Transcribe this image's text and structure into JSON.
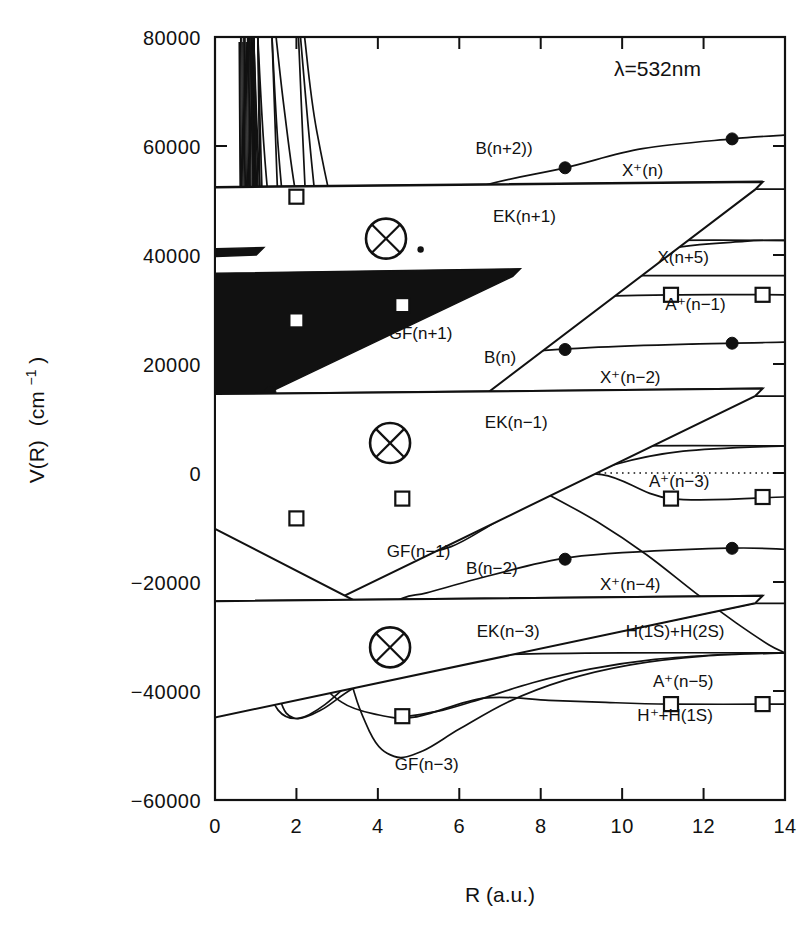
{
  "figure": {
    "annotation": "λ=532nm",
    "xlabel": "R (a.u.)",
    "ylabel_main": "V(R)",
    "ylabel_unit": "(cm",
    "ylabel_exp": "−1",
    "ylabel_close": ")"
  },
  "chart_data": {
    "type": "line",
    "title": "",
    "subtitle": "",
    "annotations": [
      "λ=532nm"
    ],
    "xlabel": "R (a.u.)",
    "ylabel": "V(R) (cm−1)",
    "xlim": [
      0,
      14
    ],
    "ylim": [
      -60000,
      80000
    ],
    "xticks": [
      0,
      2,
      4,
      6,
      8,
      10,
      12,
      14
    ],
    "yticks": [
      -60000,
      -40000,
      -20000,
      0,
      20000,
      40000,
      60000,
      80000
    ],
    "grid": false,
    "legend": "inline curve labels at right",
    "zero_line": {
      "value": 0,
      "style": "dotted"
    },
    "markers": {
      "filled-circle": "B state series",
      "open-triangle": "X+ ion series",
      "filled-triangle": "X(n+5) neutral series",
      "open-square": "A+ series",
      "crossed-circle": "avoided crossing / resonance point"
    },
    "crossing_points": [
      {
        "x": 4.2,
        "y": 43000
      },
      {
        "x": 4.3,
        "y": 5500
      },
      {
        "x": 4.3,
        "y": -32000
      }
    ],
    "series": [
      {
        "name": "B(n+2))",
        "label": "B(n+2))",
        "marker": "filled-circle",
        "asymptote": 62000,
        "points": [
          [
            0.95,
            80000
          ],
          [
            1.05,
            60000
          ],
          [
            1.2,
            40000
          ],
          [
            1.35,
            33500
          ],
          [
            1.6,
            30000
          ],
          [
            2.6,
            30500
          ],
          [
            3.2,
            35000
          ],
          [
            4.0,
            42000
          ],
          [
            5.0,
            47000
          ],
          [
            6.5,
            52500
          ],
          [
            8.6,
            56000
          ],
          [
            10.5,
            59500
          ],
          [
            12.7,
            61300
          ],
          [
            14,
            62000
          ]
        ],
        "label_pos": [
          7.1,
          58500
        ]
      },
      {
        "name": "X+(n)",
        "label": "X⁺(n)",
        "marker": "open-triangle",
        "asymptote": 52000,
        "points": [
          [
            0.9,
            80000
          ],
          [
            0.98,
            60000
          ],
          [
            1.08,
            48000
          ],
          [
            1.25,
            42000
          ],
          [
            1.5,
            40500
          ],
          [
            2.2,
            41500
          ],
          [
            3.0,
            44500
          ],
          [
            4.0,
            48500
          ],
          [
            5.0,
            50800
          ],
          [
            6.5,
            51700
          ],
          [
            9.0,
            52000
          ],
          [
            11.5,
            52100
          ],
          [
            13.4,
            52100
          ],
          [
            14,
            52100
          ]
        ],
        "label_pos": [
          10.5,
          54500
        ]
      },
      {
        "name": "EK(n+1)",
        "label": "EK(n+1)",
        "marker": "none",
        "asymptote": 42700,
        "points": [
          [
            1.05,
            80000
          ],
          [
            1.2,
            60000
          ],
          [
            1.4,
            45000
          ],
          [
            1.7,
            39000
          ],
          [
            2.2,
            37500
          ],
          [
            3.2,
            38500
          ],
          [
            4.5,
            40500
          ],
          [
            6.0,
            41800
          ],
          [
            8.5,
            42500
          ],
          [
            11.0,
            42700
          ],
          [
            14,
            42700
          ]
        ],
        "label_pos": [
          7.6,
          46000
        ]
      },
      {
        "name": "X(n+5)",
        "label": "X(n+5)",
        "marker": "filled-triangle",
        "asymptote": 36200,
        "points": [
          [
            0.85,
            80000
          ],
          [
            0.95,
            60000
          ],
          [
            1.05,
            50000
          ],
          [
            1.2,
            40000
          ],
          [
            1.45,
            35000
          ],
          [
            1.9,
            33000
          ],
          [
            2.8,
            33500
          ],
          [
            4.0,
            34800
          ],
          [
            5.5,
            35700
          ],
          [
            7.5,
            36100
          ],
          [
            10.0,
            36200
          ],
          [
            13.4,
            36200
          ],
          [
            14,
            36200
          ]
        ],
        "label_pos": [
          11.5,
          38500
        ]
      },
      {
        "name": "A+(n-1)",
        "label": "A⁺(n−1)",
        "marker": "open-square",
        "asymptote": 32700,
        "points": [
          [
            1.5,
            80000
          ],
          [
            1.7,
            66800
          ],
          [
            2.0,
            50700
          ],
          [
            2.4,
            40000
          ],
          [
            2.9,
            35000
          ],
          [
            3.6,
            32000
          ],
          [
            4.6,
            30800
          ],
          [
            6.0,
            31200
          ],
          [
            8.0,
            32100
          ],
          [
            11.2,
            32700
          ],
          [
            14,
            32700
          ]
        ],
        "label_pos": [
          11.8,
          30000
        ]
      },
      {
        "name": "GF(n+1)",
        "label": "GF(n+1)",
        "marker": "none",
        "asymptote": 42700,
        "points": [
          [
            2.2,
            80000
          ],
          [
            2.5,
            62700
          ],
          [
            3.2,
            40000
          ],
          [
            4.0,
            27000
          ],
          [
            4.8,
            22500
          ],
          [
            6.0,
            23500
          ],
          [
            7.5,
            30000
          ],
          [
            9.0,
            36500
          ],
          [
            11.0,
            41000
          ],
          [
            13.0,
            42500
          ],
          [
            14,
            42700
          ]
        ],
        "label_pos": [
          5.05,
          24500
        ]
      },
      {
        "name": "B(n)",
        "label": "B(n)",
        "marker": "filled-circle",
        "asymptote": 24000,
        "points": [
          [
            0.95,
            80000
          ],
          [
            1.1,
            42000
          ],
          [
            1.25,
            18500
          ],
          [
            1.45,
            11000
          ],
          [
            1.8,
            8000
          ],
          [
            2.6,
            8500
          ],
          [
            3.3,
            12500
          ],
          [
            4.2,
            17000
          ],
          [
            5.1,
            19500
          ],
          [
            6.5,
            21500
          ],
          [
            9.2,
            23000
          ],
          [
            11.9,
            23700
          ],
          [
            14,
            24000
          ]
        ],
        "label_pos": [
          7.0,
          20200
        ]
      },
      {
        "name": "X+(n-2)",
        "label": "X⁺(n−2)",
        "marker": "open-triangle",
        "asymptote": 14100,
        "points": [
          [
            0.9,
            80000
          ],
          [
            1.0,
            40000
          ],
          [
            1.12,
            20000
          ],
          [
            1.3,
            6500
          ],
          [
            1.55,
            2500
          ],
          [
            2.1,
            3000
          ],
          [
            3.0,
            6500
          ],
          [
            4.2,
            10500
          ],
          [
            5.2,
            12800
          ],
          [
            6.8,
            13700
          ],
          [
            9.0,
            14000
          ],
          [
            11.5,
            14100
          ],
          [
            13.4,
            14100
          ],
          [
            14,
            14100
          ]
        ],
        "label_pos": [
          10.2,
          16500
        ]
      },
      {
        "name": "EK(n-1)",
        "label": "EK(n−1)",
        "marker": "none",
        "asymptote": 5000,
        "points": [
          [
            1.05,
            80000
          ],
          [
            1.2,
            40000
          ],
          [
            1.35,
            12000
          ],
          [
            1.6,
            2000
          ],
          [
            2.0,
            0
          ],
          [
            2.8,
            700
          ],
          [
            3.8,
            2500
          ],
          [
            5.2,
            3900
          ],
          [
            7.0,
            4700
          ],
          [
            10.0,
            5000
          ],
          [
            14,
            5000
          ]
        ],
        "label_pos": [
          7.4,
          8200
        ]
      },
      {
        "name": "H(1S)+H(2S)",
        "label": "H(1S)+H(2S)",
        "marker": "none",
        "asymptote": -33000,
        "points": [
          [
            5.2,
            5000
          ],
          [
            6.0,
            4000
          ],
          [
            6.6,
            2100
          ],
          [
            7.3,
            -600
          ],
          [
            8.2,
            -4000
          ],
          [
            9.4,
            -9000
          ],
          [
            10.6,
            -15000
          ],
          [
            11.8,
            -22000
          ],
          [
            12.8,
            -27500
          ],
          [
            13.6,
            -31500
          ],
          [
            14,
            -33000
          ]
        ],
        "label_pos": [
          11.3,
          -30000
        ]
      },
      {
        "name": "A+(n-3)",
        "label": "A⁺(n−3)",
        "marker": "open-square",
        "asymptote": -4400,
        "points": [
          [
            1.4,
            80000
          ],
          [
            1.55,
            60000
          ],
          [
            1.8,
            40000
          ],
          [
            2.1,
            22000
          ],
          [
            2.5,
            6000
          ],
          [
            2.9,
            -500
          ],
          [
            3.6,
            -3500
          ],
          [
            4.6,
            -4700
          ],
          [
            6.05,
            -2700
          ],
          [
            7.5,
            -900
          ],
          [
            9.5,
            -300
          ],
          [
            11.2,
            -4700
          ],
          [
            14,
            -4400
          ]
        ],
        "label_pos": [
          11.4,
          -2500
        ]
      },
      {
        "name": "GF(n-1)",
        "label": "GF(n−1)",
        "marker": "none",
        "asymptote": 5000,
        "points": [
          [
            2.1,
            80000
          ],
          [
            2.4,
            55000
          ],
          [
            2.9,
            22000
          ],
          [
            3.5,
            -2500
          ],
          [
            4.2,
            -11500
          ],
          [
            4.9,
            -14500
          ],
          [
            5.8,
            -13500
          ],
          [
            6.9,
            -9000
          ],
          [
            8.3,
            -3000
          ],
          [
            9.8,
            1500
          ],
          [
            11.5,
            4000
          ],
          [
            14,
            5000
          ]
        ],
        "label_pos": [
          5.0,
          -15500
        ]
      },
      {
        "name": "B(n-2)",
        "label": "B(n−2)",
        "marker": "filled-circle",
        "asymptote": -14000,
        "points": [
          [
            0.95,
            80000
          ],
          [
            1.08,
            20000
          ],
          [
            1.2,
            -19000
          ],
          [
            1.4,
            -29500
          ],
          [
            1.7,
            -33500
          ],
          [
            2.2,
            -34500
          ],
          [
            2.8,
            -31500
          ],
          [
            3.6,
            -27000
          ],
          [
            4.6,
            -23000
          ],
          [
            5.2,
            -22000
          ],
          [
            6.4,
            -19500
          ],
          [
            8.0,
            -16500
          ],
          [
            9.3,
            -15000
          ],
          [
            12.6,
            -13800
          ],
          [
            14,
            -14000
          ]
        ],
        "label_pos": [
          6.8,
          -18500
        ]
      },
      {
        "name": "X+(n-4)",
        "label": "X⁺(n−4)",
        "marker": "open-triangle",
        "asymptote": -23900,
        "points": [
          [
            0.9,
            80000
          ],
          [
            1.0,
            10000
          ],
          [
            1.12,
            -25000
          ],
          [
            1.3,
            -38000
          ],
          [
            1.55,
            -43500
          ],
          [
            2.05,
            -45000
          ],
          [
            2.7,
            -42500
          ],
          [
            3.6,
            -36500
          ],
          [
            4.5,
            -31000
          ],
          [
            5.1,
            -28300
          ],
          [
            6.5,
            -25800
          ],
          [
            8.5,
            -24300
          ],
          [
            11.2,
            -23900
          ],
          [
            13.4,
            -23900
          ],
          [
            14,
            -23900
          ]
        ],
        "label_pos": [
          10.2,
          -21500
        ]
      },
      {
        "name": "EK(n-3)",
        "label": "EK(n−3)",
        "marker": "none",
        "asymptote": -33000,
        "points": [
          [
            1.05,
            80000
          ],
          [
            1.2,
            5000
          ],
          [
            1.35,
            -30000
          ],
          [
            1.6,
            -41500
          ],
          [
            1.95,
            -45000
          ],
          [
            2.6,
            -43500
          ],
          [
            3.4,
            -39500
          ],
          [
            4.5,
            -35800
          ],
          [
            5.6,
            -34300
          ],
          [
            7.3,
            -33300
          ],
          [
            10.0,
            -33000
          ],
          [
            14,
            -33000
          ]
        ],
        "label_pos": [
          7.2,
          -30000
        ]
      },
      {
        "name": "A+(n-5)",
        "label": "A⁺(n−5)",
        "marker": "open-square",
        "asymptote": -42400,
        "points": [
          [
            1.4,
            80000
          ],
          [
            1.6,
            40000
          ],
          [
            1.9,
            0
          ],
          [
            2.2,
            -25000
          ],
          [
            2.6,
            -37500
          ],
          [
            3.1,
            -42000
          ],
          [
            3.9,
            -44200
          ],
          [
            4.9,
            -44800
          ],
          [
            6.6,
            -41300
          ],
          [
            8.2,
            -41700
          ],
          [
            9.6,
            -42100
          ],
          [
            11.2,
            -42400
          ],
          [
            14,
            -42400
          ]
        ],
        "label_pos": [
          11.5,
          -39200
        ]
      },
      {
        "name": "H+ + H(1S)",
        "label": "H⁺+H(1S)",
        "marker": "none",
        "asymptote": -33000,
        "points": [
          [
            4.6,
            -44800
          ],
          [
            5.6,
            -43500
          ],
          [
            6.6,
            -41300
          ],
          [
            7.8,
            -38500
          ],
          [
            9.2,
            -36000
          ],
          [
            10.8,
            -34200
          ],
          [
            12.5,
            -33300
          ],
          [
            14,
            -33000
          ]
        ],
        "label_pos": [
          11.3,
          -45500
        ]
      },
      {
        "name": "GF(n-3)",
        "label": "GF(n−3)",
        "marker": "none",
        "asymptote": -33000,
        "points": [
          [
            2.05,
            80000
          ],
          [
            2.3,
            40000
          ],
          [
            2.7,
            0
          ],
          [
            3.2,
            -33000
          ],
          [
            3.8,
            -47500
          ],
          [
            4.4,
            -52000
          ],
          [
            5.1,
            -51000
          ],
          [
            6.0,
            -47000
          ],
          [
            7.2,
            -42000
          ],
          [
            8.6,
            -38000
          ],
          [
            10.2,
            -35200
          ],
          [
            12.0,
            -33600
          ],
          [
            14,
            -33000
          ]
        ],
        "label_pos": [
          5.2,
          -54500
        ]
      }
    ],
    "repulsive_wall_curves": 14
  }
}
